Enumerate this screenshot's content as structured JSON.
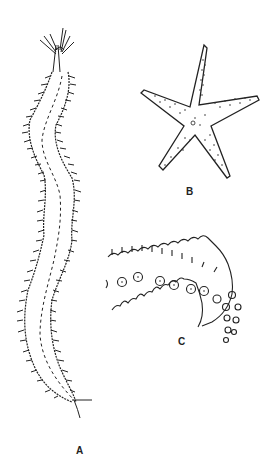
{
  "figure": {
    "panels": [
      {
        "id": "A",
        "label": "A",
        "subject": "segmented worm"
      },
      {
        "id": "B",
        "label": "B",
        "subject": "starfish"
      },
      {
        "id": "C",
        "label": "C",
        "subject": "starfish arm detail"
      }
    ],
    "colors": {
      "ink": "#222222",
      "background": "#ffffff"
    }
  }
}
